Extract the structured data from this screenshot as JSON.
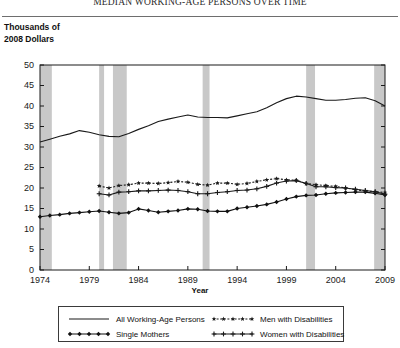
{
  "chart_data": {
    "type": "line",
    "title": "MEDIAN WORKING-AGE PERSONS OVER TIME",
    "ylabel": "Thousands of\n2008 Dollars",
    "xlabel": "Year",
    "xlim": [
      1974,
      2009
    ],
    "ylim": [
      0,
      50
    ],
    "xticks": [
      "1974",
      "1979",
      "1984",
      "1989",
      "1994",
      "1999",
      "2004",
      "2009"
    ],
    "xtick_values": [
      1974,
      1979,
      1984,
      1989,
      1994,
      1999,
      2004,
      2009
    ],
    "yticks": [
      "0",
      "5",
      "10",
      "15",
      "20",
      "25",
      "30",
      "35",
      "40",
      "45",
      "50"
    ],
    "ytick_values": [
      0,
      5,
      10,
      15,
      20,
      25,
      30,
      35,
      40,
      45,
      50
    ],
    "grid": false,
    "legend_position": "below-axes",
    "x": [
      1974,
      1975,
      1976,
      1977,
      1978,
      1979,
      1980,
      1981,
      1982,
      1983,
      1984,
      1985,
      1986,
      1987,
      1988,
      1989,
      1990,
      1991,
      1992,
      1993,
      1994,
      1995,
      1996,
      1997,
      1998,
      1999,
      2000,
      2001,
      2002,
      2003,
      2004,
      2005,
      2006,
      2007,
      2008,
      2009
    ],
    "series": [
      {
        "name": "All Working-Age Persons",
        "marker": "none",
        "linestyle": "solid",
        "color": "#1a1a1a",
        "x": [
          1974,
          1975,
          1976,
          1977,
          1978,
          1979,
          1980,
          1981,
          1982,
          1983,
          1984,
          1985,
          1986,
          1987,
          1988,
          1989,
          1990,
          1991,
          1992,
          1993,
          1994,
          1995,
          1996,
          1997,
          1998,
          1999,
          2000,
          2001,
          2002,
          2003,
          2004,
          2005,
          2006,
          2007,
          2008,
          2009
        ],
        "values": [
          31.2,
          31.9,
          32.6,
          33.2,
          34.0,
          33.6,
          33.0,
          32.6,
          32.5,
          33.3,
          34.3,
          35.2,
          36.2,
          36.8,
          37.3,
          37.8,
          37.3,
          37.2,
          37.2,
          37.1,
          37.6,
          38.1,
          38.6,
          39.6,
          40.8,
          41.8,
          42.4,
          42.2,
          41.8,
          41.4,
          41.4,
          41.6,
          41.9,
          42.0,
          41.3,
          40.0
        ]
      },
      {
        "name": "Single Mothers",
        "marker": "diamond-filled",
        "linestyle": "solid",
        "color": "#111111",
        "x": [
          1974,
          1975,
          1976,
          1977,
          1978,
          1979,
          1980,
          1981,
          1982,
          1983,
          1984,
          1985,
          1986,
          1987,
          1988,
          1989,
          1990,
          1991,
          1992,
          1993,
          1994,
          1995,
          1996,
          1997,
          1998,
          1999,
          2000,
          2001,
          2002,
          2003,
          2004,
          2005,
          2006,
          2007,
          2008,
          2009
        ],
        "values": [
          13.0,
          13.3,
          13.5,
          13.8,
          14.0,
          14.2,
          14.4,
          14.1,
          13.8,
          14.0,
          14.9,
          14.5,
          14.1,
          14.3,
          14.5,
          14.9,
          14.8,
          14.4,
          14.3,
          14.3,
          15.0,
          15.3,
          15.6,
          16.0,
          16.6,
          17.3,
          17.9,
          18.2,
          18.3,
          18.6,
          18.8,
          18.9,
          19.0,
          19.0,
          18.7,
          18.3
        ]
      },
      {
        "name": "Men with Disabilities",
        "marker": "star",
        "linestyle": "dotted",
        "color": "#1a1a1a",
        "x": [
          1980,
          1981,
          1982,
          1983,
          1984,
          1985,
          1986,
          1987,
          1988,
          1989,
          1990,
          1991,
          1992,
          1993,
          1994,
          1995,
          1996,
          1997,
          1998,
          1999,
          2000,
          2001,
          2002,
          2003,
          2004,
          2005,
          2006,
          2007,
          2008,
          2009
        ],
        "values": [
          20.5,
          20.0,
          20.6,
          20.8,
          21.2,
          21.2,
          21.1,
          21.3,
          21.6,
          21.4,
          20.9,
          20.7,
          21.2,
          21.2,
          20.9,
          21.1,
          21.6,
          22.0,
          22.3,
          22.0,
          21.9,
          21.1,
          20.8,
          20.6,
          20.4,
          20.0,
          19.6,
          19.3,
          19.1,
          18.9
        ]
      },
      {
        "name": "Women with Disabilities",
        "marker": "plus",
        "linestyle": "solid",
        "color": "#1a1a1a",
        "x": [
          1980,
          1981,
          1982,
          1983,
          1984,
          1985,
          1986,
          1987,
          1988,
          1989,
          1990,
          1991,
          1992,
          1993,
          1994,
          1995,
          1996,
          1997,
          1998,
          1999,
          2000,
          2001,
          2002,
          2003,
          2004,
          2005,
          2006,
          2007,
          2008,
          2009
        ],
        "values": [
          18.6,
          18.3,
          19.0,
          19.1,
          19.3,
          19.3,
          19.4,
          19.5,
          19.4,
          19.1,
          18.6,
          18.6,
          18.9,
          19.1,
          19.4,
          19.5,
          19.8,
          20.4,
          21.2,
          21.7,
          21.8,
          21.1,
          20.3,
          20.3,
          20.1,
          20.0,
          19.7,
          19.4,
          19.1,
          18.5
        ]
      }
    ],
    "recession_bands": [
      {
        "start": 1974.0,
        "end": 1975.2
      },
      {
        "start": 1980.0,
        "end": 1980.5
      },
      {
        "start": 1981.4,
        "end": 1982.8
      },
      {
        "start": 1990.5,
        "end": 1991.2
      },
      {
        "start": 2001.0,
        "end": 2001.9
      },
      {
        "start": 2007.9,
        "end": 2009.0
      }
    ],
    "recession_band_color": "#c8c8c8",
    "axis_color": "#1a1a1a",
    "background": "#ffffff"
  }
}
